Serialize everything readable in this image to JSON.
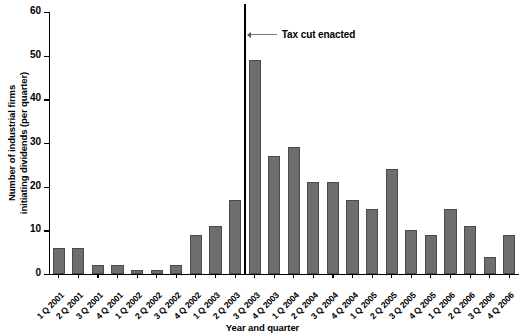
{
  "chart_data": {
    "type": "bar",
    "title": "",
    "xlabel": "Year and quarter",
    "ylabel": "Number of industrial firms initiating dividends (per quarter)",
    "ylabel_line1": "Number of industrial firms",
    "ylabel_line2": "initiating dividends (per quarter)",
    "ylim": [
      0,
      60
    ],
    "ytick_values": [
      0,
      10,
      20,
      30,
      40,
      50,
      60
    ],
    "ytick_labels": [
      "0",
      "10",
      "20",
      "30",
      "40",
      "50",
      "60"
    ],
    "grid": false,
    "legend": null,
    "bar_color": "#6e6e6e",
    "bar_edge_color": "#4a4a4a",
    "categories": [
      "1 Q 2001",
      "2 Q 2001",
      "3 Q 2001",
      "4 Q 2001",
      "1 Q 2002",
      "2 Q 2002",
      "3 Q 2002",
      "4 Q 2002",
      "1 Q 2003",
      "2 Q 2003",
      "3 Q 2003",
      "4 Q 2003",
      "1 Q 2004",
      "2 Q 2004",
      "3 Q 2004",
      "4 Q 2004",
      "1 Q 2005",
      "2 Q 2005",
      "3 Q 2005",
      "4 Q 2005",
      "1 Q 2006",
      "2 Q 2006",
      "3 Q 2006",
      "4 Q 2006"
    ],
    "values": [
      6,
      6,
      2,
      2,
      1,
      1,
      2,
      9,
      11,
      17,
      49,
      27,
      29,
      21,
      21,
      17,
      15,
      24,
      10,
      9,
      15,
      11,
      4,
      9
    ],
    "annotations": [
      {
        "text": "Tax cut enacted",
        "type": "vertical-line-with-label",
        "at_category_boundary_index": 10,
        "line_color": "#000000"
      }
    ]
  }
}
